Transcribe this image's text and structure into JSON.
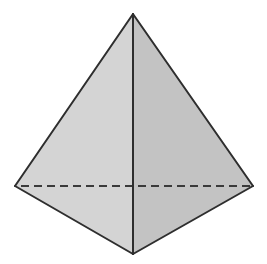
{
  "diagram": {
    "type": "tetrahedron",
    "vertices": {
      "apex": [
        133,
        14
      ],
      "left": [
        15,
        186
      ],
      "right": [
        253,
        186
      ],
      "front": [
        133,
        254
      ]
    },
    "colors": {
      "background": "#ffffff",
      "left_face": "#d4d4d4",
      "right_face": "#c3c3c3",
      "edge": "#2e2e2e",
      "hidden_edge": "#3a3a3a"
    },
    "hidden_edge_dash": "8 5"
  }
}
